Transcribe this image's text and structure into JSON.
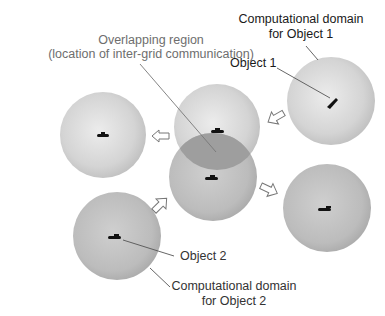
{
  "diagram": {
    "labels": {
      "overlap_line1": "Overlapping region",
      "overlap_line2": "(location of inter-grid communication)",
      "domain1_line1": "Computational domain",
      "domain1_line2": "for Object 1",
      "object1": "Object 1",
      "object2": "Object 2",
      "domain2_line1": "Computational domain",
      "domain2_line2": "for Object 2"
    },
    "colors": {
      "light_sphere": "#d6d6d6",
      "mid_sphere": "#bdbdbd",
      "overlap": "#9d9d9d",
      "label_dark": "#1a1a1a",
      "label_gray": "#6e6e6e"
    },
    "spheres": [
      {
        "name": "sphere-left",
        "cx": 103,
        "cy": 135,
        "r": 43
      },
      {
        "name": "sphere-top-center",
        "cx": 217,
        "cy": 127,
        "r": 43
      },
      {
        "name": "sphere-center",
        "cx": 213,
        "cy": 177,
        "r": 44
      },
      {
        "name": "sphere-object1",
        "cx": 331,
        "cy": 101,
        "r": 44
      },
      {
        "name": "sphere-right-bottom",
        "cx": 327,
        "cy": 208,
        "r": 44
      },
      {
        "name": "sphere-object2",
        "cx": 117,
        "cy": 236,
        "r": 44
      }
    ]
  }
}
